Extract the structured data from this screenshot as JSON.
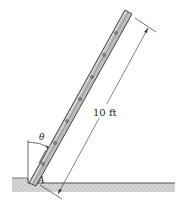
{
  "diagram": {
    "length_label": "10 ft",
    "angle_label": "θ",
    "point_label": "A",
    "colors": {
      "ladder_fill": "#b9b9b9",
      "ladder_edge": "#4a4a4a",
      "ground": "#c8c8c8",
      "line": "#333333"
    }
  }
}
